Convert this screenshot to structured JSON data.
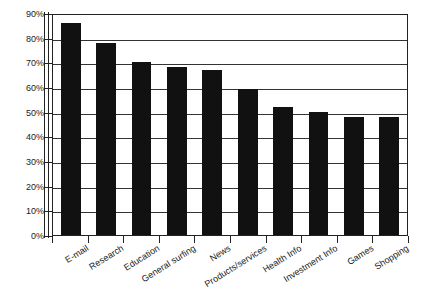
{
  "chart_data": {
    "type": "bar",
    "title": "",
    "subtitle": "",
    "xlabel": "",
    "ylabel": "",
    "ylim": [
      0,
      90
    ],
    "y_tick_step": 10,
    "grid": true,
    "legend": "none",
    "orientation": "vertical",
    "bar_color": "#111111",
    "axis_color": "#222222",
    "value_format": "percent",
    "categories": [
      "E-mail",
      "Research",
      "Education",
      "General surfing",
      "News",
      "Products/services",
      "Health Info",
      "Investment Info",
      "Games",
      "Shopping"
    ],
    "values": [
      86,
      78,
      70,
      68,
      67,
      59,
      52,
      50,
      48,
      48
    ],
    "y_tick_labels": [
      "90%",
      "80%",
      "70%",
      "60%",
      "50%",
      "40%",
      "30%",
      "20%",
      "10%",
      "0%"
    ],
    "y_tick_values": [
      90,
      80,
      70,
      60,
      50,
      40,
      30,
      20,
      10,
      0
    ]
  }
}
